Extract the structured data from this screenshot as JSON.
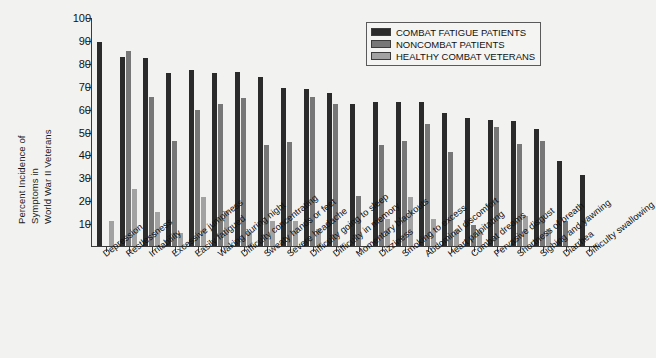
{
  "chart_data": {
    "type": "bar",
    "title": "",
    "xlabel": "",
    "ylabel": "Percent Incidence of Symptoms in World War II Veterans",
    "ylabel_lines": [
      "Percent Incidence of",
      "Symptoms in",
      "World War II Veterans"
    ],
    "ylim": [
      0,
      100
    ],
    "yticks": [
      10,
      20,
      30,
      40,
      50,
      60,
      70,
      80,
      90,
      100
    ],
    "ytick_labels": [
      "10",
      "20",
      "30",
      "40",
      "50",
      "60",
      "70",
      "80",
      "90",
      "100"
    ],
    "grid": false,
    "legend_position": "top-right",
    "categories": [
      "Depression",
      "Restlessness",
      "Irritability",
      "Excessive jumpiness",
      "Easily fatigued",
      "Waking during night",
      "Difficulty concentrating",
      "Sweaty hands or feet",
      "Severe headache",
      "Difficulty going to sleep",
      "Difficulty in memory",
      "Momentary blackouts",
      "Dizziness",
      "Smoking to excess",
      "Abdominal discomfort",
      "Heart palpitating",
      "Combat dreams",
      "Pervasive disgust",
      "Shortness of breath",
      "Sighing and yawning",
      "Diarrhea",
      "Difficulty swallowing"
    ],
    "series": [
      {
        "name": "COMBAT FATIGUE PATIENTS",
        "color": "#2b2b2b",
        "values": [
          89,
          82.5,
          82,
          75.5,
          77,
          75.5,
          76,
          74,
          69,
          68.5,
          67,
          62,
          63,
          63,
          63,
          58,
          56,
          55,
          54.5,
          51,
          37,
          31
        ]
      },
      {
        "name": "NONCOMBAT PATIENTS",
        "color": "#777777",
        "values": [
          null,
          85,
          65,
          46,
          59.5,
          62,
          64.5,
          44,
          45.5,
          65,
          62,
          22,
          44,
          46,
          53.5,
          41,
          9,
          52,
          44.5,
          46,
          11,
          null
        ]
      },
      {
        "name": "HEALTHY COMBAT VETERANS",
        "color": "#a2a2a2",
        "values": [
          11,
          25,
          15,
          5.5,
          21.5,
          15.5,
          6,
          11,
          11,
          7.5,
          null,
          null,
          12,
          21.5,
          12,
          7,
          7,
          null,
          13,
          7.5,
          null,
          null
        ]
      }
    ]
  },
  "legend": {
    "items": [
      {
        "label": "COMBAT FATIGUE PATIENTS",
        "swatch": "s0"
      },
      {
        "label": "NONCOMBAT PATIENTS",
        "swatch": "s1"
      },
      {
        "label": "HEALTHY COMBAT VETERANS",
        "swatch": "s2"
      }
    ]
  }
}
